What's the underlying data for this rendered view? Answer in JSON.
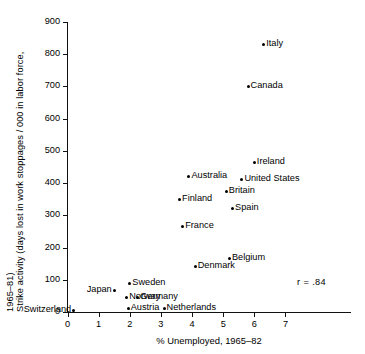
{
  "chart_data": {
    "type": "scatter",
    "title": "",
    "xlabel": "% Unemployed, 1965–82",
    "ylabel_line1": "Strike activity (days lost in work stoppages / 000 in labor force,",
    "ylabel_line2": "1965–81)",
    "xlim": [
      0,
      7.6
    ],
    "ylim": [
      0,
      900
    ],
    "xticks": [
      "0",
      "1",
      "2",
      "3",
      "4",
      "5",
      "6",
      "7"
    ],
    "xtick_values": [
      0,
      1,
      2,
      3,
      4,
      5,
      6,
      7
    ],
    "yticks": [
      "0",
      "100",
      "200",
      "300",
      "400",
      "500",
      "600",
      "700",
      "800",
      "900"
    ],
    "ytick_values": [
      0,
      100,
      200,
      300,
      400,
      500,
      600,
      700,
      800,
      900
    ],
    "grid": false,
    "legend": false,
    "annotation": "r  =  .84",
    "points": [
      {
        "label": "Italy",
        "x": 6.3,
        "y": 830,
        "label_side": "right"
      },
      {
        "label": "Canada",
        "x": 5.8,
        "y": 700,
        "label_side": "right"
      },
      {
        "label": "Ireland",
        "x": 6.0,
        "y": 465,
        "label_side": "right"
      },
      {
        "label": "United States",
        "x": 5.6,
        "y": 410,
        "label_side": "right"
      },
      {
        "label": "Australia",
        "x": 3.9,
        "y": 420,
        "label_side": "right"
      },
      {
        "label": "Britain",
        "x": 5.1,
        "y": 375,
        "label_side": "right"
      },
      {
        "label": "Finland",
        "x": 3.6,
        "y": 350,
        "label_side": "right"
      },
      {
        "label": "Spain",
        "x": 5.3,
        "y": 320,
        "label_side": "right"
      },
      {
        "label": "France",
        "x": 3.7,
        "y": 265,
        "label_side": "right"
      },
      {
        "label": "Belgium",
        "x": 5.2,
        "y": 165,
        "label_side": "right"
      },
      {
        "label": "Denmark",
        "x": 4.1,
        "y": 140,
        "label_side": "right"
      },
      {
        "label": "Sweden",
        "x": 2.0,
        "y": 90,
        "label_side": "right"
      },
      {
        "label": "Japan",
        "x": 1.5,
        "y": 68,
        "label_side": "left"
      },
      {
        "label": "Norway",
        "x": 1.9,
        "y": 45,
        "label_side": "right"
      },
      {
        "label": "Germany",
        "x": 2.25,
        "y": 45,
        "label_side": "right"
      },
      {
        "label": "Switzerland",
        "x": 0.2,
        "y": 5,
        "label_side": "left"
      },
      {
        "label": "Austria",
        "x": 1.95,
        "y": 10,
        "label_side": "right"
      },
      {
        "label": "Netherlands",
        "x": 3.1,
        "y": 10,
        "label_side": "right"
      }
    ]
  }
}
